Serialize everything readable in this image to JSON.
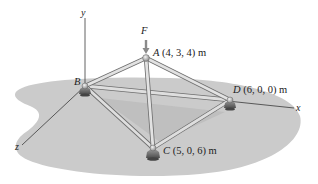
{
  "figure": {
    "type": "3D space truss diagram",
    "colors": {
      "ground": "#c9c9c9",
      "ground_shadow": "#b4b4b4",
      "member": "#d8d8d8",
      "member_edge": "#6e6e6e",
      "axis": "#3a3a3a",
      "force_arrow": "#8a8a8a"
    },
    "axes": {
      "x_label": "x",
      "y_label": "y",
      "z_label": "z"
    },
    "force": {
      "label": "F",
      "direction": "downward at A"
    },
    "joints": [
      {
        "id": "A",
        "name": "A",
        "coords": "(4, 3, 4) m"
      },
      {
        "id": "B",
        "name": "B",
        "coords": ""
      },
      {
        "id": "C",
        "name": "C",
        "coords": "(5, 0, 6) m"
      },
      {
        "id": "D",
        "name": "D",
        "coords": "(6, 0, 0) m"
      }
    ],
    "members": [
      "AB",
      "AC",
      "AD",
      "BC",
      "BD",
      "CD"
    ]
  }
}
